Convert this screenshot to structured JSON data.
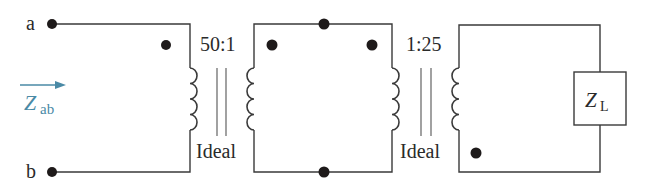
{
  "diagram": {
    "type": "circuit",
    "terminals": {
      "a": "a",
      "b": "b"
    },
    "input_impedance": {
      "symbol": "Z",
      "subscript": "ab",
      "color": "#4a8aa6"
    },
    "transformers": [
      {
        "ratio": "50:1",
        "label": "Ideal"
      },
      {
        "ratio": "1:25",
        "label": "Ideal"
      }
    ],
    "load": {
      "symbol": "Z",
      "subscript": "L"
    }
  }
}
